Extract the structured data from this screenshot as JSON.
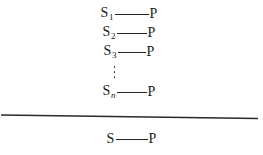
{
  "figure": {
    "background_color": "#ffffff",
    "ink_color": "#222222",
    "pairs": [
      {
        "substrate": "S",
        "subscript": "1",
        "subscript_italic": false,
        "product": "P",
        "bond_length_px": 34
      },
      {
        "substrate": "S",
        "subscript": "2",
        "subscript_italic": false,
        "product": "P",
        "bond_length_px": 30
      },
      {
        "substrate": "S",
        "subscript": "3",
        "subscript_italic": false,
        "product": "P",
        "bond_length_px": 28
      },
      {
        "substrate": "S",
        "subscript": "n",
        "subscript_italic": true,
        "product": "P",
        "bond_length_px": 30
      }
    ],
    "ellipsis": {
      "glyph": "⋮",
      "dot_count": 3,
      "orientation": "vertical"
    },
    "divider": {
      "style": "solid",
      "slant": "slight-downward-to-right"
    },
    "summary_pair": {
      "substrate": "S",
      "subscript": "",
      "product": "P",
      "bond_length_px": 32
    }
  }
}
